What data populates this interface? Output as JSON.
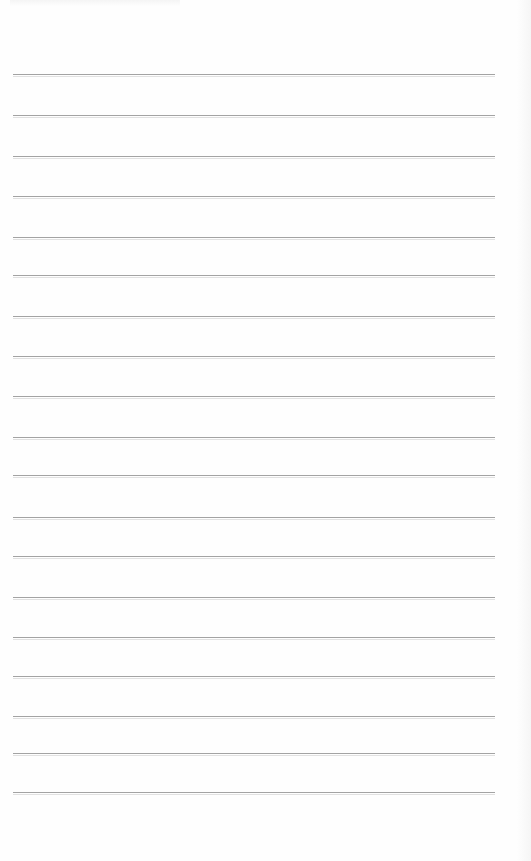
{
  "page": {
    "type": "ruled-notebook-paper",
    "background_color": "#fefefe",
    "line_color": "#a3a3a3",
    "text_content": ""
  },
  "rules": {
    "left": 13,
    "right": 495,
    "y_positions": [
      75,
      116,
      157,
      197,
      238,
      276,
      317,
      357,
      397,
      438,
      476,
      518,
      557,
      598,
      638,
      677,
      717,
      754,
      793
    ]
  }
}
